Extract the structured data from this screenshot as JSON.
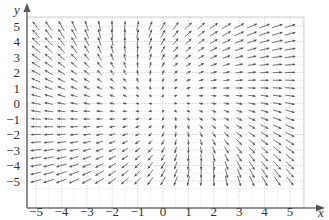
{
  "chart_data": {
    "type": "vector_field",
    "title": "",
    "xlabel": "x",
    "ylabel": "y",
    "xlim": [
      -5.5,
      5.5
    ],
    "ylim": [
      -5.5,
      5.5
    ],
    "grid": true,
    "x_ticks": [
      -5,
      -4,
      -3,
      -2,
      -1,
      0,
      1,
      2,
      3,
      4,
      5
    ],
    "y_ticks": [
      -5,
      -4,
      -3,
      -2,
      -1,
      0,
      1,
      2,
      3,
      4,
      5
    ],
    "x_tick_labels": [
      "−5",
      "−4",
      "−3",
      "−2",
      "−1",
      "0",
      "1",
      "2",
      "3",
      "4",
      "5"
    ],
    "y_tick_labels": [
      "−5",
      "−4",
      "−3",
      "−2",
      "−1",
      "0",
      "1",
      "2",
      "3",
      "4",
      "5"
    ],
    "sample_spacing": 0.5,
    "sample_range": [
      -5,
      5
    ],
    "field_description": "Source-like field: vectors near zero at origin, pointing outward; left half points left, right half points right, upper half points up, lower half points down, with slight counter-clockwise twist",
    "field_formula_approx": {
      "u": "x + 0.35*y",
      "v": "y - 0.35*x"
    },
    "colors": {
      "arrow": "#555555",
      "grid": "#bbbbbb",
      "axis": "#666666",
      "text": "#333333"
    }
  }
}
